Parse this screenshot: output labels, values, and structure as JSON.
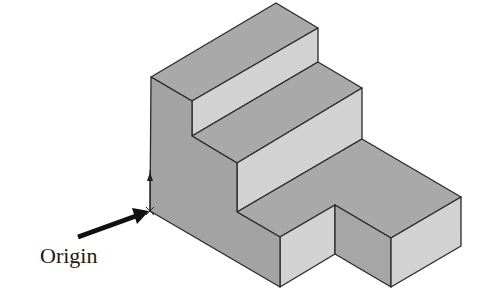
{
  "figure": {
    "type": "isometric-stepped-block",
    "label": "Origin",
    "colors": {
      "top_face": "#a9a9a9",
      "riser_face": "#d2d2d2",
      "left_face": "#a3a3a3",
      "notch_face": "#a6a6a6",
      "edge": "#2a2a2a",
      "arrow": "#111111"
    },
    "faces": [
      {
        "name": "top-face-upper-step",
        "points": "151,77 276,3 318,28 192,101",
        "fill": "top"
      },
      {
        "name": "riser-upper-step",
        "points": "192,101 318,28 318,62 192,136",
        "fill": "riser"
      },
      {
        "name": "top-face-middle-step",
        "points": "192,136 318,62 362,88 237,163",
        "fill": "top"
      },
      {
        "name": "riser-middle-step",
        "points": "237,163 362,88 362,139 237,212",
        "fill": "riser"
      },
      {
        "name": "top-face-lower-l-shape",
        "points": "237,212 362,139 461,197 391,238 335,205 280,237",
        "fill": "top"
      },
      {
        "name": "front-face-left-block",
        "points": "280,237 335,205 335,254 280,287",
        "fill": "riser"
      },
      {
        "name": "notch-side-face",
        "points": "335,205 391,238 391,287 335,254",
        "fill": "notch"
      },
      {
        "name": "front-face-right-block",
        "points": "391,238 461,197 461,246 391,287",
        "fill": "riser"
      },
      {
        "name": "left-side-face",
        "points": "151,77 192,101 192,136 237,163 237,212 280,237 280,287 150,211",
        "fill": "left"
      }
    ],
    "arrow": {
      "x1": 78,
      "y1": 237,
      "x2": 149,
      "y2": 211
    }
  }
}
